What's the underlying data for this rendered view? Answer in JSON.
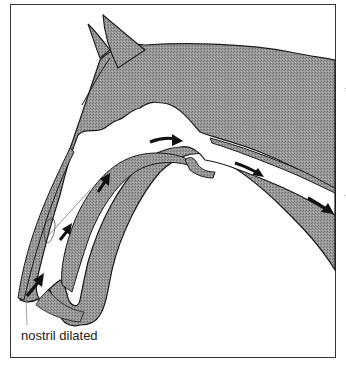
{
  "figure": {
    "labels": {
      "nostril": "nostril dilated"
    },
    "colors": {
      "tissue_fill": "#8c8c8c",
      "outline": "#1a1a1a",
      "airway": "#ffffff",
      "arrow": "#111111"
    },
    "arrows": [
      {
        "name": "arrow-nostril-entry",
        "direction": "up-right"
      },
      {
        "name": "arrow-nasal-mid",
        "direction": "up-right"
      },
      {
        "name": "arrow-nasal-upper",
        "direction": "up-right"
      },
      {
        "name": "arrow-pharynx",
        "direction": "right"
      },
      {
        "name": "arrow-trachea-1",
        "direction": "down-right"
      },
      {
        "name": "arrow-trachea-2",
        "direction": "down-right"
      }
    ]
  }
}
